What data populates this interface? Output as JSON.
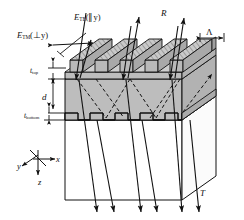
{
  "figure": {
    "type": "optics-schematic-3d",
    "background": "#ffffff",
    "colors": {
      "slab_fill": "#bdbdbd",
      "ridge_top_fill": "#c9c9c9",
      "side_face_fill": "#b0b0b0",
      "substrate_fill": "#ffffff",
      "line": "#1a1a1a",
      "hatch": "#8a8a8a"
    }
  },
  "labels": {
    "e_tm": {
      "symbol": "E",
      "sub": "TM",
      "arg": "(⊥y)",
      "full": "E_TM(⊥y)"
    },
    "e_te": {
      "symbol": "E",
      "sub": "TE",
      "arg": "(∥y)",
      "full": "E_TE(∥y)"
    },
    "reflection": "R",
    "transmission": "T",
    "period": "Λ",
    "t_top": {
      "symbol": "t",
      "sub": "top"
    },
    "d": "d",
    "t_bottom": {
      "symbol": "t",
      "sub": "bottom"
    }
  },
  "axes": {
    "x": "x",
    "y": "y",
    "z": "z"
  },
  "geometry": {
    "grating_periods_top": 5,
    "grating_periods_bottom": 5,
    "incident_rays": 3,
    "reflected_rays": 3,
    "transmitted_rays": 6,
    "internal_dashed_rays": 6
  }
}
